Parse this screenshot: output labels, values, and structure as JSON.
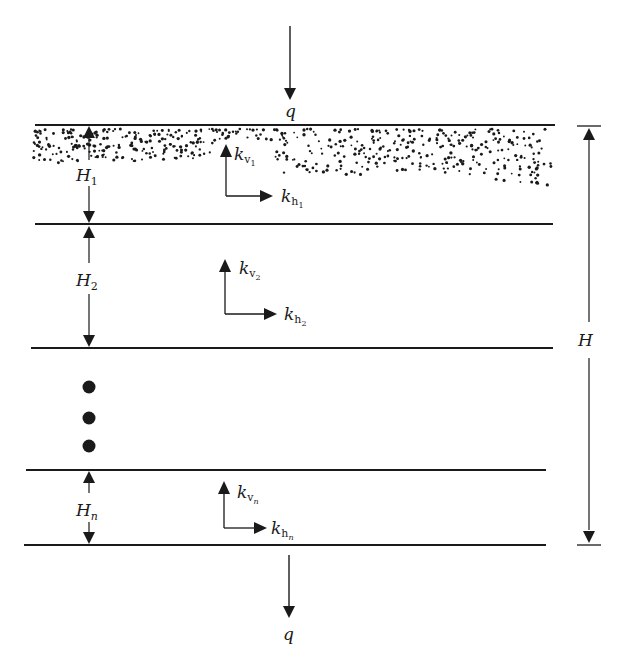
{
  "diagram": {
    "title": "",
    "type": "layered-soil-permeability",
    "colors": {
      "ink": "#1a1a1a",
      "background": "#ffffff"
    },
    "flow": {
      "top_label": "q",
      "bottom_label": "q"
    },
    "total_thickness": {
      "label": "H"
    },
    "layers": [
      {
        "thickness_label": "H",
        "thickness_sub": "1",
        "kv_base": "k",
        "kv_sub": "v",
        "kv_subsub": "1",
        "kh_base": "k",
        "kh_sub": "h",
        "kh_subsub": "1",
        "fill": "sand-dotted"
      },
      {
        "thickness_label": "H",
        "thickness_sub": "2",
        "kv_base": "k",
        "kv_sub": "v",
        "kv_subsub": "2",
        "kh_base": "k",
        "kh_sub": "h",
        "kh_subsub": "2",
        "fill": "none"
      },
      {
        "thickness_label": "H",
        "thickness_sub": "n",
        "kv_base": "k",
        "kv_sub": "v",
        "kv_subsub": "n",
        "kh_base": "k",
        "kh_sub": "h",
        "kh_subsub": "n",
        "fill": "none"
      }
    ],
    "ellipsis": {
      "count": 3,
      "meaning": "intermediate layers"
    }
  }
}
